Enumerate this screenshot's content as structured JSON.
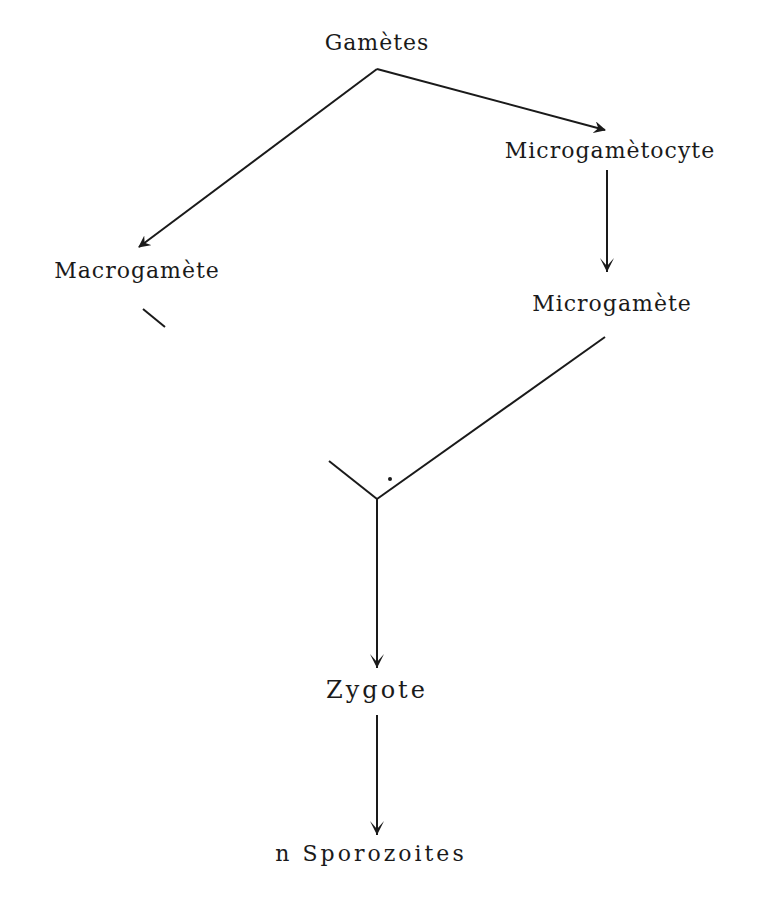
{
  "diagram": {
    "type": "flow",
    "nodes": {
      "gametes": "Gamètes",
      "microgametocyte": "Microgamètocyte",
      "macrogamete": "Macrogamète",
      "microgamete": "Microgamète",
      "zygote": "Zygote",
      "sporozoites": "n Sporozoites"
    },
    "edges": [
      {
        "from": "gametes",
        "to": "macrogamete",
        "arrow": true
      },
      {
        "from": "gametes",
        "to": "microgametocyte",
        "arrow": true
      },
      {
        "from": "microgametocyte",
        "to": "microgamete",
        "arrow": true
      },
      {
        "from": "macrogamete",
        "to": "zygote",
        "arrow": false,
        "note": "merge"
      },
      {
        "from": "microgamete",
        "to": "zygote",
        "arrow": false,
        "note": "merge"
      },
      {
        "from": "zygote",
        "to": "sporozoites",
        "arrow": true
      }
    ],
    "line_color": "#1a1a1a"
  }
}
